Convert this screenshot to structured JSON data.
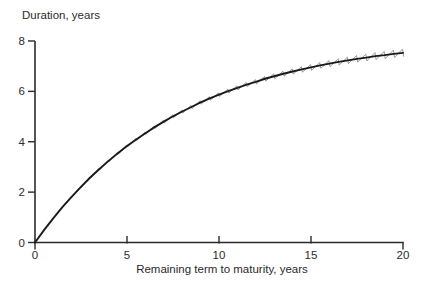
{
  "chart_data": {
    "type": "line",
    "title": "",
    "ylabel": "Duration, years",
    "xlabel": "Remaining term to maturity, years",
    "xlim": [
      0,
      20
    ],
    "ylim": [
      0,
      8
    ],
    "x_ticks": [
      0,
      5,
      10,
      15,
      20
    ],
    "x_tick_labels": [
      "0",
      "5",
      "10",
      "15",
      "20"
    ],
    "y_ticks": [
      0,
      2,
      4,
      6,
      8
    ],
    "y_tick_labels": [
      "0",
      "2",
      "4",
      "6",
      "8"
    ],
    "grid": false,
    "legend": "none",
    "colors": {
      "smooth_curve": "#1a1a1a",
      "sawtooth_curve": "#8f8f8f",
      "axis": "#2b2b2b",
      "background": "#ffffff"
    },
    "series": [
      {
        "name": "smooth duration curve (par coupon bond)",
        "style": "solid thick black line",
        "x": [
          0,
          0.5,
          1,
          1.5,
          2,
          2.5,
          3,
          3.5,
          4,
          4.5,
          5,
          5.5,
          6,
          6.5,
          7,
          7.5,
          8,
          8.5,
          9,
          9.5,
          10,
          10.5,
          11,
          11.5,
          12,
          12.5,
          13,
          13.5,
          14,
          14.5,
          15,
          15.5,
          16,
          16.5,
          17,
          17.5,
          18,
          18.5,
          19,
          19.5,
          20
        ],
        "y": [
          0,
          0.5,
          0.97,
          1.41,
          1.82,
          2.21,
          2.58,
          2.92,
          3.24,
          3.54,
          3.83,
          4.09,
          4.34,
          4.58,
          4.8,
          5.01,
          5.2,
          5.38,
          5.56,
          5.72,
          5.87,
          6.01,
          6.14,
          6.27,
          6.38,
          6.5,
          6.6,
          6.7,
          6.79,
          6.87,
          6.95,
          7.03,
          7.1,
          7.17,
          7.23,
          7.29,
          7.34,
          7.4,
          7.44,
          7.49,
          7.53
        ],
        "note": "duration rises from 0 at maturity 0, through about 3.8 at 5 years and 5.9 at 10 years, flattening toward about 7.5 at 20 years"
      },
      {
        "name": "exact coupon-bond duration (sawtooth oscillating around smooth curve at semiannual coupon dates)",
        "style": "thin gray zigzag line",
        "derived_from_series": 0,
        "tooth_period_years": 0.5,
        "visible_from_x": 2,
        "amplitude_years_per_unit_x": 0.0075
      }
    ]
  }
}
